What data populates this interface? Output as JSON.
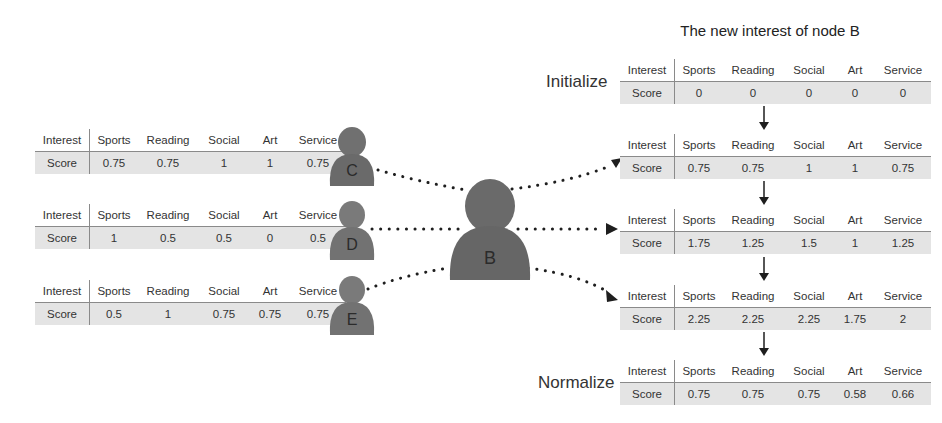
{
  "title": "The new interest of node B",
  "colors": {
    "person_fill": "#6f6f6f",
    "score_row_bg": "#e4e4e4",
    "rule_line": "#8a8a8a",
    "arrow": "#1e1e1e"
  },
  "neighbors": [
    {
      "node": "C",
      "table": {
        "header": [
          "Interest",
          "Sports",
          "Reading",
          "Social",
          "Art",
          "Service"
        ],
        "row": [
          "Score",
          "0.75",
          "0.75",
          "1",
          "1",
          "0.75"
        ]
      }
    },
    {
      "node": "D",
      "table": {
        "header": [
          "Interest",
          "Sports",
          "Reading",
          "Social",
          "Art",
          "Service"
        ],
        "row": [
          "Score",
          "1",
          "0.5",
          "0.5",
          "0",
          "0.5"
        ]
      }
    },
    {
      "node": "E",
      "table": {
        "header": [
          "Interest",
          "Sports",
          "Reading",
          "Social",
          "Art",
          "Service"
        ],
        "row": [
          "Score",
          "0.5",
          "1",
          "0.75",
          "0.75",
          "0.75"
        ]
      }
    }
  ],
  "center_node": {
    "node": "B"
  },
  "steps": [
    {
      "label": "Initialize",
      "table": {
        "header": [
          "Interest",
          "Sports",
          "Reading",
          "Social",
          "Art",
          "Service"
        ],
        "row": [
          "Score",
          "0",
          "0",
          "0",
          "0",
          "0"
        ]
      }
    },
    {
      "label": "",
      "table": {
        "header": [
          "Interest",
          "Sports",
          "Reading",
          "Social",
          "Art",
          "Service"
        ],
        "row": [
          "Score",
          "0.75",
          "0.75",
          "1",
          "1",
          "0.75"
        ]
      }
    },
    {
      "label": "",
      "table": {
        "header": [
          "Interest",
          "Sports",
          "Reading",
          "Social",
          "Art",
          "Service"
        ],
        "row": [
          "Score",
          "1.75",
          "1.25",
          "1.5",
          "1",
          "1.25"
        ]
      }
    },
    {
      "label": "",
      "table": {
        "header": [
          "Interest",
          "Sports",
          "Reading",
          "Social",
          "Art",
          "Service"
        ],
        "row": [
          "Score",
          "2.25",
          "2.25",
          "2.25",
          "1.75",
          "2"
        ]
      }
    },
    {
      "label": "Normalize",
      "table": {
        "header": [
          "Interest",
          "Sports",
          "Reading",
          "Social",
          "Art",
          "Service"
        ],
        "row": [
          "Score",
          "0.75",
          "0.75",
          "0.75",
          "0.58",
          "0.66"
        ]
      }
    }
  ]
}
